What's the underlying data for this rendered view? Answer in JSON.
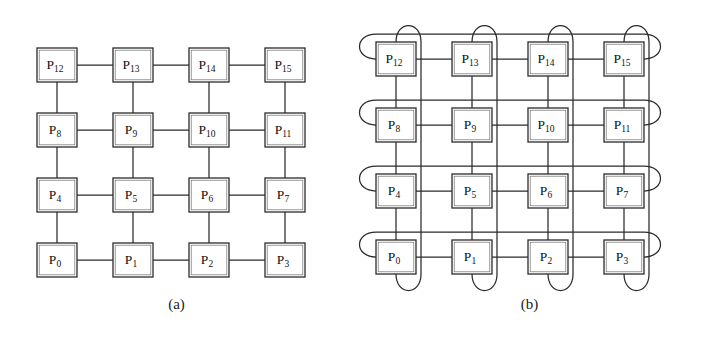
{
  "figure": {
    "background_color": "#ffffff",
    "line_color": "#2b2b2b",
    "node_fill": "#ffffff",
    "width": 706,
    "height": 344
  },
  "panels": [
    {
      "id": "a",
      "caption": "(a)",
      "type": "mesh",
      "topology": "2D mesh (4x4), no wraparound links",
      "rows": 4,
      "cols": 4,
      "wraparound": false,
      "geometry": {
        "origin_x": 37,
        "origin_y": 48,
        "col_step": 76,
        "row_step": 65,
        "box_w": 40,
        "box_h": 34
      },
      "nodes": [
        {
          "id": 12,
          "label": "P",
          "sub": "12",
          "row": 0,
          "col": 0
        },
        {
          "id": 13,
          "label": "P",
          "sub": "13",
          "row": 0,
          "col": 1
        },
        {
          "id": 14,
          "label": "P",
          "sub": "14",
          "row": 0,
          "col": 2
        },
        {
          "id": 15,
          "label": "P",
          "sub": "15",
          "row": 0,
          "col": 3
        },
        {
          "id": 8,
          "label": "P",
          "sub": "8",
          "row": 1,
          "col": 0
        },
        {
          "id": 9,
          "label": "P",
          "sub": "9",
          "row": 1,
          "col": 1
        },
        {
          "id": 10,
          "label": "P",
          "sub": "10",
          "row": 1,
          "col": 2
        },
        {
          "id": 11,
          "label": "P",
          "sub": "11",
          "row": 1,
          "col": 3
        },
        {
          "id": 4,
          "label": "P",
          "sub": "4",
          "row": 2,
          "col": 0
        },
        {
          "id": 5,
          "label": "P",
          "sub": "5",
          "row": 2,
          "col": 1
        },
        {
          "id": 6,
          "label": "P",
          "sub": "6",
          "row": 2,
          "col": 2
        },
        {
          "id": 7,
          "label": "P",
          "sub": "7",
          "row": 2,
          "col": 3
        },
        {
          "id": 0,
          "label": "P",
          "sub": "0",
          "row": 3,
          "col": 0
        },
        {
          "id": 1,
          "label": "P",
          "sub": "1",
          "row": 3,
          "col": 1
        },
        {
          "id": 2,
          "label": "P",
          "sub": "2",
          "row": 3,
          "col": 2
        },
        {
          "id": 3,
          "label": "P",
          "sub": "3",
          "row": 3,
          "col": 3
        }
      ],
      "edges": [
        [
          12,
          13
        ],
        [
          13,
          14
        ],
        [
          14,
          15
        ],
        [
          8,
          9
        ],
        [
          9,
          10
        ],
        [
          10,
          11
        ],
        [
          4,
          5
        ],
        [
          5,
          6
        ],
        [
          6,
          7
        ],
        [
          0,
          1
        ],
        [
          1,
          2
        ],
        [
          2,
          3
        ],
        [
          12,
          8
        ],
        [
          8,
          4
        ],
        [
          4,
          0
        ],
        [
          13,
          9
        ],
        [
          9,
          5
        ],
        [
          5,
          1
        ],
        [
          14,
          10
        ],
        [
          10,
          6
        ],
        [
          6,
          2
        ],
        [
          15,
          11
        ],
        [
          11,
          7
        ],
        [
          7,
          3
        ]
      ],
      "wrap_edges_horizontal": [],
      "wrap_edges_vertical": []
    },
    {
      "id": "b",
      "caption": "(b)",
      "type": "torus",
      "topology": "2D torus (4x4), wraparound links on rows and columns",
      "rows": 4,
      "cols": 4,
      "wraparound": true,
      "geometry": {
        "origin_x": 23,
        "origin_y": 42,
        "col_step": 76,
        "row_step": 66,
        "box_w": 40,
        "box_h": 34,
        "h_wrap_offset_y": -25,
        "h_wrap_bulge": 22,
        "v_wrap_offset_x": 25,
        "v_wrap_bulge": 22
      },
      "nodes": [
        {
          "id": 12,
          "label": "P",
          "sub": "12",
          "row": 0,
          "col": 0
        },
        {
          "id": 13,
          "label": "P",
          "sub": "13",
          "row": 0,
          "col": 1
        },
        {
          "id": 14,
          "label": "P",
          "sub": "14",
          "row": 0,
          "col": 2
        },
        {
          "id": 15,
          "label": "P",
          "sub": "15",
          "row": 0,
          "col": 3
        },
        {
          "id": 8,
          "label": "P",
          "sub": "8",
          "row": 1,
          "col": 0
        },
        {
          "id": 9,
          "label": "P",
          "sub": "9",
          "row": 1,
          "col": 1
        },
        {
          "id": 10,
          "label": "P",
          "sub": "10",
          "row": 1,
          "col": 2
        },
        {
          "id": 11,
          "label": "P",
          "sub": "11",
          "row": 1,
          "col": 3
        },
        {
          "id": 4,
          "label": "P",
          "sub": "4",
          "row": 2,
          "col": 0
        },
        {
          "id": 5,
          "label": "P",
          "sub": "5",
          "row": 2,
          "col": 1
        },
        {
          "id": 6,
          "label": "P",
          "sub": "6",
          "row": 2,
          "col": 2
        },
        {
          "id": 7,
          "label": "P",
          "sub": "7",
          "row": 2,
          "col": 3
        },
        {
          "id": 0,
          "label": "P",
          "sub": "0",
          "row": 3,
          "col": 0
        },
        {
          "id": 1,
          "label": "P",
          "sub": "1",
          "row": 3,
          "col": 1
        },
        {
          "id": 2,
          "label": "P",
          "sub": "2",
          "row": 3,
          "col": 2
        },
        {
          "id": 3,
          "label": "P",
          "sub": "3",
          "row": 3,
          "col": 3
        }
      ],
      "edges": [
        [
          12,
          13
        ],
        [
          13,
          14
        ],
        [
          14,
          15
        ],
        [
          8,
          9
        ],
        [
          9,
          10
        ],
        [
          10,
          11
        ],
        [
          4,
          5
        ],
        [
          5,
          6
        ],
        [
          6,
          7
        ],
        [
          0,
          1
        ],
        [
          1,
          2
        ],
        [
          2,
          3
        ],
        [
          12,
          8
        ],
        [
          8,
          4
        ],
        [
          4,
          0
        ],
        [
          13,
          9
        ],
        [
          9,
          5
        ],
        [
          5,
          1
        ],
        [
          14,
          10
        ],
        [
          10,
          6
        ],
        [
          6,
          2
        ],
        [
          15,
          11
        ],
        [
          11,
          7
        ],
        [
          7,
          3
        ]
      ],
      "wrap_edges_horizontal": [
        {
          "row": 0,
          "from": 12,
          "to": 15
        },
        {
          "row": 1,
          "from": 8,
          "to": 11
        },
        {
          "row": 2,
          "from": 4,
          "to": 7
        },
        {
          "row": 3,
          "from": 0,
          "to": 3
        }
      ],
      "wrap_edges_vertical": [
        {
          "col": 0,
          "from": 12,
          "to": 0
        },
        {
          "col": 1,
          "from": 13,
          "to": 1
        },
        {
          "col": 2,
          "from": 14,
          "to": 2
        },
        {
          "col": 3,
          "from": 15,
          "to": 3
        }
      ]
    }
  ]
}
